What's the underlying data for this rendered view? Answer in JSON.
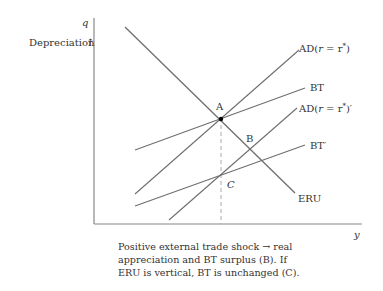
{
  "axes": {
    "y_label": "q",
    "x_label": "y",
    "direction_label": "Depreciation",
    "direction_arrow": "↑"
  },
  "curves": [
    {
      "name": "ERU",
      "label": "ERU"
    },
    {
      "name": "AD",
      "label_prefix": "AD(",
      "label_r": "r",
      "label_eq": " = r",
      "label_sup": "*",
      "label_suffix": ")"
    },
    {
      "name": "BT",
      "label": "BT"
    },
    {
      "name": "AD-prime",
      "label_prefix": "AD(",
      "label_r": "r",
      "label_eq": " = r",
      "label_sup": "*",
      "label_suffix": ")′"
    },
    {
      "name": "BT-prime",
      "label": "BT′"
    }
  ],
  "points": {
    "A": "A",
    "B": "B",
    "C": "C"
  },
  "caption": {
    "line1": "Positive external trade shock → real",
    "line2": "appreciation and BT surplus (B). If",
    "line3": "ERU is vertical, BT is unchanged (C)."
  },
  "colors": {
    "line": "#6e6e6e",
    "axis": "#888888",
    "dashed": "#aaaaaa",
    "text": "#333333",
    "point": "#000000"
  }
}
